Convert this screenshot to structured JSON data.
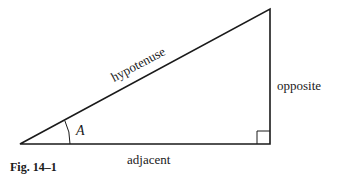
{
  "figure": {
    "caption": "Fig. 14–1",
    "labels": {
      "hypotenuse": "hypotenuse",
      "opposite": "opposite",
      "adjacent": "adjacent",
      "angle": "A"
    },
    "stroke_color": "#1a1a1a"
  }
}
